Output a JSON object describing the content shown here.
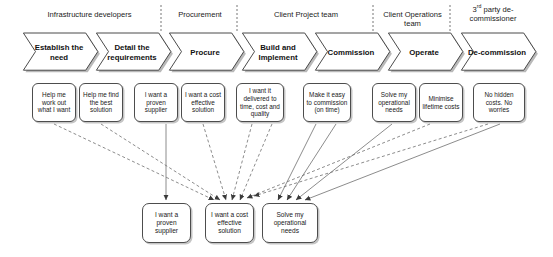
{
  "diagram": {
    "background_color": "#ffffff",
    "line_color": "#666666",
    "box_border_color": "#4d4d4d"
  },
  "lanes": [
    {
      "id": "lane-infrastructure-developers",
      "label": "Infrastructure developers",
      "left": 18,
      "width": 143
    },
    {
      "id": "lane-procurement",
      "label": "Procurement",
      "left": 163,
      "width": 74
    },
    {
      "id": "lane-client-project-team",
      "label": "Client Project team",
      "left": 239,
      "width": 134
    },
    {
      "id": "lane-client-operations-team",
      "label": "Client Operations team",
      "left": 375,
      "width": 75
    },
    {
      "id": "lane-third-party-decommissioner",
      "label_html": "3<sup>rd</sup> party de-commissioner",
      "label": "3rd party de-commissioner",
      "left": 452,
      "width": 82
    }
  ],
  "lane_dividers": [
    161,
    237,
    373,
    450
  ],
  "stages": [
    {
      "id": "stage-establish-the-need",
      "label": "Establish the need",
      "left": 22,
      "width": 80
    },
    {
      "id": "stage-detail-the-requirements",
      "label": "Detail the requirements",
      "left": 95,
      "width": 80
    },
    {
      "id": "stage-procure",
      "label": "Procure",
      "left": 168,
      "width": 80
    },
    {
      "id": "stage-build-and-implement",
      "label": "Build and Implement",
      "left": 241,
      "width": 80
    },
    {
      "id": "stage-commission",
      "label": "Commission",
      "left": 314,
      "width": 80
    },
    {
      "id": "stage-operate",
      "label": "Operate",
      "left": 387,
      "width": 80
    },
    {
      "id": "stage-de-commission",
      "label": "De-commission",
      "left": 460,
      "width": 80
    }
  ],
  "needs": [
    {
      "id": "need-help-me-work-out",
      "label": "Help me work out what I want",
      "left": 32,
      "top": 83,
      "width": 44,
      "height": 39
    },
    {
      "id": "need-help-me-find-best-solution",
      "label": "Help me find the best solution",
      "left": 79,
      "top": 83,
      "width": 44,
      "height": 39
    },
    {
      "id": "need-proven-supplier",
      "label": "I want a proven supplier",
      "left": 134,
      "top": 83,
      "width": 44,
      "height": 39
    },
    {
      "id": "need-cost-effective-solution",
      "label": "I want a cost effective solution",
      "left": 181,
      "top": 83,
      "width": 44,
      "height": 39
    },
    {
      "id": "need-delivered-to-time-cost-quality",
      "label": "I want it delivered to time, cost and quality",
      "left": 236,
      "top": 83,
      "width": 48,
      "height": 39
    },
    {
      "id": "need-easy-to-commission",
      "label": "Make it easy to commission (on time)",
      "left": 303,
      "top": 83,
      "width": 48,
      "height": 39
    },
    {
      "id": "need-solve-operational-needs",
      "label": "Solve my operational needs",
      "left": 372,
      "top": 83,
      "width": 44,
      "height": 39
    },
    {
      "id": "need-minimise-lifetime-costs",
      "label": "Minimise lifetime costs",
      "left": 419,
      "top": 83,
      "width": 44,
      "height": 39
    },
    {
      "id": "need-no-hidden-costs",
      "label": "No hidden costs. No worries",
      "left": 473,
      "top": 83,
      "width": 52,
      "height": 39
    }
  ],
  "consolidated": [
    {
      "id": "consolidated-proven-supplier",
      "label": "I want a proven supplier",
      "left": 142,
      "top": 203,
      "width": 49,
      "height": 40
    },
    {
      "id": "consolidated-cost-effective-solution",
      "label": "I want a cost effective solution",
      "left": 205,
      "top": 203,
      "width": 49,
      "height": 40
    },
    {
      "id": "consolidated-solve-operational-needs",
      "label": "Solve my operational needs",
      "left": 262,
      "top": 203,
      "width": 56,
      "height": 40
    }
  ],
  "connectors": {
    "dashed_color": "#6e6e6e",
    "solid_color": "#6e6e6e",
    "edges": [
      {
        "from": "need-help-me-work-out",
        "to": "consolidated-cost-effective-solution",
        "style": "dashed",
        "x1": 54,
        "y1": 124,
        "x2": 214,
        "y2": 200
      },
      {
        "from": "need-help-me-find-best-solution",
        "to": "consolidated-cost-effective-solution",
        "style": "dashed",
        "x1": 101,
        "y1": 124,
        "x2": 220,
        "y2": 200
      },
      {
        "from": "need-proven-supplier",
        "to": "consolidated-proven-supplier",
        "style": "solid",
        "x1": 166,
        "y1": 124,
        "x2": 166,
        "y2": 200
      },
      {
        "from": "need-cost-effective-solution",
        "to": "consolidated-cost-effective-solution",
        "style": "dashed",
        "x1": 203,
        "y1": 124,
        "x2": 226,
        "y2": 200
      },
      {
        "from": "need-delivered-to-time-cost-quality",
        "to": "consolidated-cost-effective-solution",
        "style": "dashed",
        "x1": 252,
        "y1": 124,
        "x2": 232,
        "y2": 200
      },
      {
        "from": "need-delivered-to-time-cost-quality",
        "to": "consolidated-cost-effective-solution",
        "style": "dashed",
        "x1": 272,
        "y1": 124,
        "x2": 240,
        "y2": 200
      },
      {
        "from": "need-easy-to-commission",
        "to": "consolidated-solve-operational-needs",
        "style": "solid",
        "x1": 316,
        "y1": 124,
        "x2": 278,
        "y2": 200
      },
      {
        "from": "need-easy-to-commission",
        "to": "consolidated-solve-operational-needs",
        "style": "solid",
        "x1": 336,
        "y1": 124,
        "x2": 287,
        "y2": 200
      },
      {
        "from": "need-solve-operational-needs",
        "to": "consolidated-solve-operational-needs",
        "style": "solid",
        "x1": 392,
        "y1": 124,
        "x2": 296,
        "y2": 200
      },
      {
        "from": "need-minimise-lifetime-costs",
        "to": "consolidated-cost-effective-solution",
        "style": "dashed",
        "x1": 430,
        "y1": 124,
        "x2": 247,
        "y2": 198
      },
      {
        "from": "need-no-hidden-costs",
        "to": "consolidated-cost-effective-solution",
        "style": "dashed",
        "x1": 488,
        "y1": 124,
        "x2": 254,
        "y2": 196
      },
      {
        "from": "need-no-hidden-costs",
        "to": "consolidated-solve-operational-needs",
        "style": "solid",
        "x1": 500,
        "y1": 124,
        "x2": 305,
        "y2": 200
      }
    ]
  }
}
